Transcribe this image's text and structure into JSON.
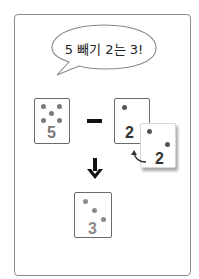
{
  "speech_bubble": {
    "text": "5 빼기 2는 3!"
  },
  "cards": {
    "left": {
      "number": "5",
      "dots": 5,
      "number_color": "#7a7a7a"
    },
    "right": {
      "number": "2",
      "dots": 2,
      "number_color": "#333333"
    },
    "moved": {
      "number": "2",
      "dots": 2,
      "number_color": "#333333"
    },
    "result": {
      "number": "3",
      "dots": 3,
      "number_color": "#8a8a8a"
    }
  },
  "operator": "minus",
  "colors": {
    "dot": "#7a7a7a",
    "frame": "#8a8a8a",
    "card_border": "#6b6b6b",
    "arrow": "#111111"
  }
}
